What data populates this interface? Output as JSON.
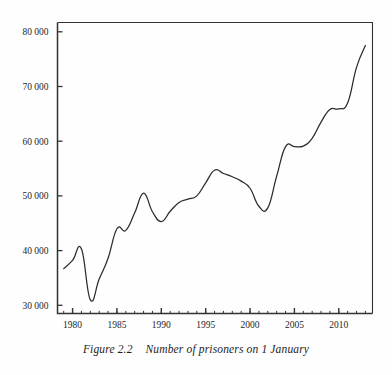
{
  "caption": {
    "figure_number": "Figure 2.2",
    "text": "Number of prisoners on 1 January",
    "full": "Figure 2.2    Number of prisoners on 1 January"
  },
  "colors": {
    "line": "#2b2b2b",
    "axis": "#333333",
    "text": "#262626",
    "background": "#fefefe"
  },
  "axes": {
    "y_tick_labels": [
      "80 000",
      "70 000",
      "60 000",
      "50 000",
      "40 000",
      "30 000"
    ],
    "y_tick_values": [
      80000,
      70000,
      60000,
      50000,
      40000,
      30000
    ],
    "x_tick_labels": [
      "1980",
      "1985",
      "1990",
      "1995",
      "2000",
      "2005",
      "2010"
    ],
    "x_tick_values": [
      1980,
      1985,
      1990,
      1995,
      2000,
      2005,
      2010
    ]
  },
  "chart_data": {
    "type": "line",
    "title": "Number of prisoners on 1 January",
    "xlabel": "",
    "ylabel": "",
    "grid": false,
    "legend": "none",
    "xlim": [
      1978.3,
      2013.8
    ],
    "ylim": [
      28500,
      81700
    ],
    "x": [
      1979,
      1980,
      1981,
      1982,
      1983,
      1984,
      1985,
      1986,
      1987,
      1988,
      1989,
      1990,
      1991,
      1992,
      1993,
      1994,
      1995,
      1996,
      1997,
      1998,
      1999,
      2000,
      2001,
      2002,
      2003,
      2004,
      2005,
      2006,
      2007,
      2008,
      2009,
      2010,
      2011,
      2012,
      2013
    ],
    "values": [
      36700,
      38200,
      40300,
      31000,
      34800,
      38600,
      44000,
      43700,
      46900,
      50500,
      47100,
      45300,
      47200,
      48800,
      49400,
      50000,
      52400,
      54700,
      54100,
      53500,
      52700,
      51400,
      48100,
      47800,
      53600,
      59000,
      59000,
      59100,
      60500,
      63500,
      65800,
      65900,
      67000,
      73500,
      77500
    ],
    "y_major_ticks": [
      30000,
      40000,
      50000,
      60000,
      70000,
      80000
    ],
    "x_major_ticks": [
      1980,
      1985,
      1990,
      1995,
      2000,
      2005,
      2010
    ],
    "x_minor_tick_interval": 1,
    "notes": {
      "peak_1981": 40300,
      "trough_1982": 31000,
      "peak_1988": 50500,
      "dip_1990": 45300,
      "peak_1996": 54700,
      "trough_2002": 47800,
      "plateau_2004_2006": 59000,
      "plateau_2009_2010": 65900,
      "final_2013": 77500
    }
  }
}
